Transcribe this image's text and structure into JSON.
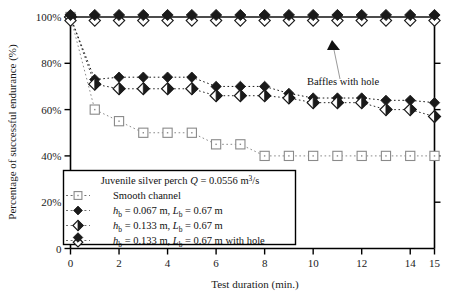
{
  "chart_data": {
    "type": "line",
    "title": "",
    "xlabel": "Test duration (min.)",
    "ylabel": "Percentage of successful endurance (%)",
    "xlim": [
      0,
      15
    ],
    "ylim": [
      0,
      100
    ],
    "xticks": [
      0,
      2,
      4,
      6,
      8,
      10,
      12,
      14,
      15
    ],
    "xtick_labels": [
      "0",
      "2",
      "4",
      "6",
      "8",
      "10",
      "12",
      "14",
      "15"
    ],
    "yticks": [
      0,
      20,
      40,
      60,
      80,
      100
    ],
    "ytick_labels": [
      "0",
      "20%",
      "40%",
      "60%",
      "80%",
      "100%"
    ],
    "grid": false,
    "legend_position": "lower-left-inside",
    "x": [
      0,
      1,
      2,
      3,
      4,
      5,
      6,
      7,
      8,
      9,
      10,
      11,
      12,
      13,
      14,
      15
    ],
    "series": [
      {
        "name": "Smooth channel",
        "marker": "open-square",
        "linestyle": "dotted",
        "color": "#8a8a8a",
        "values": [
          100,
          60,
          55,
          50,
          50,
          50,
          45,
          45,
          40,
          40,
          40,
          40,
          40,
          40,
          40,
          40
        ]
      },
      {
        "name": "h_b = 0.067 m, L_b = 0.67 m",
        "marker": "filled-diamond",
        "linestyle": "dotted",
        "color": "#1a1a1a",
        "values": [
          100,
          73,
          74,
          74,
          74,
          74,
          70,
          70,
          70,
          67,
          65,
          65,
          65,
          64,
          64,
          63
        ]
      },
      {
        "name": "h_b = 0.133 m, L_b = 0.67 m",
        "marker": "half-diamond",
        "linestyle": "dotted",
        "color": "#2a2a2a",
        "values": [
          100,
          71,
          69,
          69,
          69,
          69,
          66,
          66,
          66,
          65,
          63,
          63,
          63,
          60,
          60,
          57
        ]
      },
      {
        "name": "h_b = 0.133 m, L_b = 0.67 m with hole",
        "marker": "baffle-diamond",
        "linestyle": "solid",
        "color": "#111111",
        "values": [
          100,
          100,
          100,
          100,
          100,
          100,
          100,
          100,
          100,
          100,
          100,
          100,
          100,
          100,
          100,
          100
        ]
      }
    ],
    "annotations": [
      {
        "text": "Baffles with hole",
        "x": 11.0,
        "y": 84
      }
    ]
  },
  "legend": {
    "title_prefix": "Juvenile silver perch ",
    "title_q": "Q",
    "title_eq": " = 0.0556 m",
    "title_sup": "3",
    "title_tail": "/s",
    "entries": [
      {
        "label": "Smooth channel",
        "marker": "open-square"
      },
      {
        "label_parts": {
          "h": "h",
          "hsub": "b",
          "mid": " = 0.067 m, ",
          "l": "L",
          "lsub": "b",
          "tail": " = 0.67 m"
        },
        "marker": "filled-diamond"
      },
      {
        "label_parts": {
          "h": "h",
          "hsub": "b",
          "mid": " = 0.133 m, ",
          "l": "L",
          "lsub": "b",
          "tail": " = 0.67 m"
        },
        "marker": "half-diamond"
      },
      {
        "label_parts": {
          "h": "h",
          "hsub": "b",
          "mid": " = 0.133 m, ",
          "l": "L",
          "lsub": "b",
          "tail": " = 0.67 m with hole"
        },
        "marker": "baffle-diamond"
      }
    ]
  },
  "annotation": {
    "text": "Baffles with hole"
  }
}
